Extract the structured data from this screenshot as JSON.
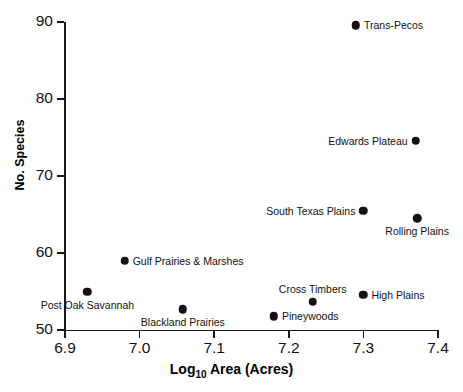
{
  "chart_data": {
    "type": "scatter",
    "title": "",
    "xlabel": "Log10 Area (Acres)",
    "xlabel_base": "Log",
    "xlabel_sub": "10",
    "xlabel_rest": " Area (Acres)",
    "ylabel": "No. Species",
    "xlim": [
      6.9,
      7.4
    ],
    "ylim": [
      50,
      90
    ],
    "xticks": [
      "6.9",
      "7.0",
      "7.1",
      "7.2",
      "7.3",
      "7.4"
    ],
    "xtick_values": [
      6.9,
      7.0,
      7.1,
      7.2,
      7.3,
      7.4
    ],
    "yticks": [
      "50",
      "60",
      "70",
      "80",
      "90"
    ],
    "ytick_values": [
      50,
      60,
      70,
      80,
      90
    ],
    "grid": false,
    "legend": "none",
    "points": [
      {
        "label": "Trans-Pecos",
        "x": 7.29,
        "y": 89.6,
        "label_pos": "right"
      },
      {
        "label": "Edwards Plateau",
        "x": 7.37,
        "y": 74.6,
        "label_pos": "left"
      },
      {
        "label": "South Texas Plains",
        "x": 7.3,
        "y": 65.5,
        "label_pos": "left"
      },
      {
        "label": "Rolling Plains",
        "x": 7.372,
        "y": 64.5,
        "label_pos": "below"
      },
      {
        "label": "Gulf Prairies & Marshes",
        "x": 6.98,
        "y": 59.0,
        "label_pos": "right"
      },
      {
        "label": "Post Oak Savannah",
        "x": 6.93,
        "y": 55.0,
        "label_pos": "below"
      },
      {
        "label": "High Plains",
        "x": 7.3,
        "y": 54.6,
        "label_pos": "right"
      },
      {
        "label": "Cross Timbers",
        "x": 7.232,
        "y": 53.7,
        "label_pos": "above"
      },
      {
        "label": "Blackland Prairies",
        "x": 7.058,
        "y": 52.7,
        "label_pos": "below"
      },
      {
        "label": "Pineywoods",
        "x": 7.18,
        "y": 51.8,
        "label_pos": "right"
      }
    ]
  },
  "colors": {
    "marker": "#121212",
    "axis": "#1a1a1a",
    "text": "#111111",
    "background": "#ffffff"
  }
}
